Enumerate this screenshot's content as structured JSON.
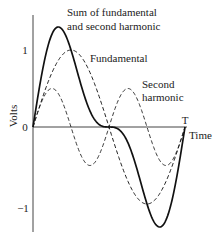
{
  "chart_data": {
    "type": "line",
    "title": "",
    "xlabel": "Time",
    "ylabel": "Volts",
    "x_end_label": "T",
    "yticks": [
      {
        "value": 1,
        "label": "1"
      },
      {
        "value": 0,
        "label": "0"
      },
      {
        "value": -1,
        "label": "−1"
      }
    ],
    "ylim": [
      -1.35,
      1.35
    ],
    "xlim": [
      0,
      1
    ],
    "grid": false,
    "series": [
      {
        "name": "Sum of fundamental and second harmonic",
        "style": "solid",
        "formula": "sin(2*pi*t) + 0.5*sin(4*pi*t)",
        "x": [
          0,
          0.125,
          0.25,
          0.375,
          0.5,
          0.625,
          0.75,
          0.875,
          1
        ],
        "values": [
          0,
          1.21,
          1.0,
          0.21,
          0,
          -0.21,
          -1.0,
          -1.21,
          0
        ]
      },
      {
        "name": "Fundamental",
        "style": "dashed",
        "formula": "sin(2*pi*t)",
        "x": [
          0,
          0.25,
          0.5,
          0.75,
          1
        ],
        "values": [
          0,
          1,
          0,
          -1,
          0
        ]
      },
      {
        "name": "Second harmonic",
        "style": "dashed",
        "formula": "0.5*sin(4*pi*t)",
        "x": [
          0,
          0.125,
          0.25,
          0.375,
          0.5,
          0.625,
          0.75,
          0.875,
          1
        ],
        "values": [
          0,
          0.5,
          0,
          -0.5,
          0,
          0.5,
          0,
          -0.5,
          0
        ]
      }
    ],
    "annotations": [
      {
        "text_line1": "Sum of fundamental",
        "text_line2": "and second harmonic"
      },
      {
        "text_line1": "Fundamental"
      },
      {
        "text_line1": "Second",
        "text_line2": "harmonic"
      }
    ]
  }
}
